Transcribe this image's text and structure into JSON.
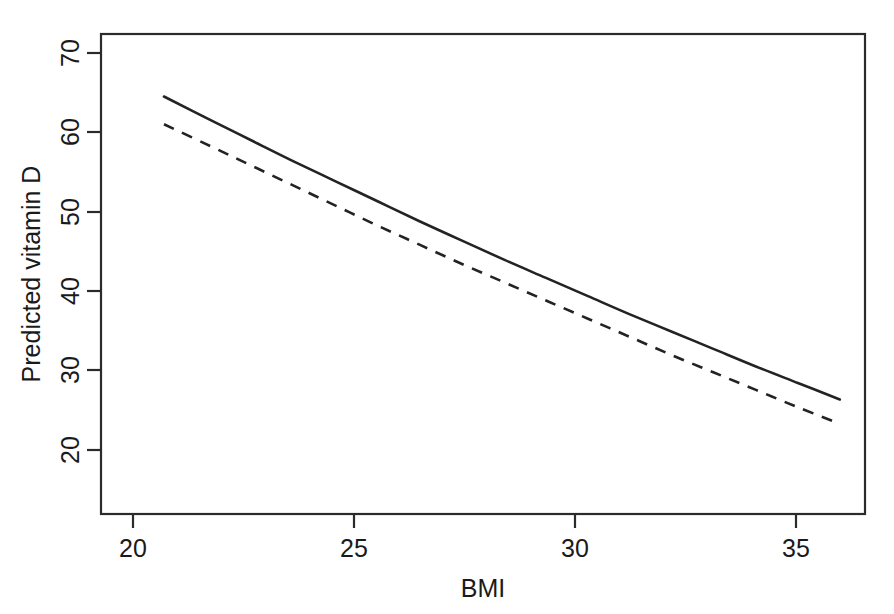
{
  "figure": {
    "background_color": "#ffffff",
    "line_color": "#232323",
    "axis_color": "#2b2b2b"
  },
  "axes": {
    "x_title": "BMI",
    "y_title": "Predicted vitamin D",
    "x_ticks": [
      "20",
      "25",
      "30",
      "35"
    ],
    "y_ticks": [
      "20",
      "30",
      "40",
      "50",
      "60",
      "70"
    ]
  },
  "chart_data": {
    "type": "line",
    "title": "",
    "subtitle": "",
    "xlabel": "BMI",
    "ylabel": "Predicted vitamin D",
    "xlim": [
      18.4,
      36.6
    ],
    "ylim": [
      17.2,
      72.5
    ],
    "xticks": [
      20,
      25,
      30,
      35
    ],
    "yticks": [
      20,
      30,
      40,
      50,
      60,
      70
    ],
    "grid": false,
    "legend": "none",
    "x": [
      19.9,
      21.0,
      22.0,
      23.0,
      24.0,
      25.0,
      26.0,
      27.0,
      28.0,
      29.0,
      30.0,
      31.0,
      32.0,
      33.0,
      34.0,
      35.0,
      36.0
    ],
    "series": [
      {
        "name": "Solid curve",
        "style": "solid",
        "values": [
          65.3,
          62.6,
          60.2,
          57.8,
          55.5,
          53.2,
          50.9,
          48.7,
          46.5,
          44.4,
          42.3,
          40.2,
          38.2,
          36.2,
          34.2,
          32.3,
          30.4
        ]
      },
      {
        "name": "Dashed curve",
        "style": "dashed",
        "values": [
          62.1,
          59.6,
          57.3,
          55.0,
          52.7,
          50.4,
          48.2,
          46.0,
          43.9,
          41.8,
          39.7,
          37.6,
          35.5,
          33.5,
          31.5,
          29.5,
          27.6
        ]
      }
    ]
  }
}
